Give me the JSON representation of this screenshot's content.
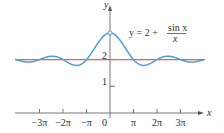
{
  "chart_data": {
    "type": "line",
    "title": "",
    "xlabel": "x",
    "ylabel": "y",
    "annotation": {
      "prefix": "y = 2 + ",
      "numerator": "sin x",
      "denominator": "x"
    },
    "x_ticks": [
      {
        "value": -9.42478,
        "label": "−3π"
      },
      {
        "value": -6.28319,
        "label": "−2π"
      },
      {
        "value": -3.14159,
        "label": "−π"
      },
      {
        "value": 3.14159,
        "label": "π"
      },
      {
        "value": 6.28319,
        "label": "2π"
      },
      {
        "value": 9.42478,
        "label": "3π"
      }
    ],
    "origin_label": "0",
    "y_ticks": [
      {
        "value": 1,
        "label": "1"
      },
      {
        "value": 2,
        "label": "2"
      }
    ],
    "xlim": [
      -12.0,
      12.5
    ],
    "ylim": [
      0,
      4.0
    ],
    "grid": false,
    "series": [
      {
        "name": "y = 2 + sin(x)/x",
        "color": "#4a9fd8",
        "function": "2 + sin(x)/x",
        "hole_at": {
          "x": 0,
          "y": 3
        }
      },
      {
        "name": "y = 2",
        "color": "#e0664a",
        "function": "2"
      }
    ]
  }
}
